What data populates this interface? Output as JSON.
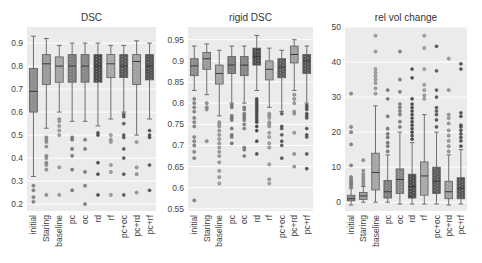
{
  "chart_data": [
    {
      "type": "box",
      "title": "DSC",
      "xlabel": "",
      "ylabel": "",
      "ylim": [
        0.17,
        0.97
      ],
      "yticks": [
        0.2,
        0.3,
        0.4,
        0.5,
        0.6,
        0.7,
        0.8,
        0.9
      ],
      "ytick_labels": [
        "0.2",
        "0.3",
        "0.4",
        "0.5",
        "0.6",
        "0.7",
        "0.8",
        "0.9"
      ],
      "grid": true,
      "categories": [
        "initial",
        "Staring",
        "baseline",
        "pc",
        "oc",
        "rd",
        "rf",
        "pc+oc",
        "pc+rd",
        "pc+rf"
      ],
      "series": [
        {
          "name": "initial",
          "whisker_high": 0.93,
          "q3": 0.79,
          "median": 0.69,
          "q1": 0.6,
          "whisker_low": 0.32,
          "outliers": [
            0.28,
            0.26,
            0.23,
            0.21
          ]
        },
        {
          "name": "Staring",
          "whisker_high": 0.92,
          "q3": 0.85,
          "median": 0.81,
          "q1": 0.72,
          "whisker_low": 0.53,
          "outliers": [
            0.49,
            0.48,
            0.47,
            0.45,
            0.41,
            0.4,
            0.38,
            0.37,
            0.35,
            0.24
          ]
        },
        {
          "name": "baseline",
          "whisker_high": 0.89,
          "q3": 0.84,
          "median": 0.8,
          "q1": 0.73,
          "whisker_low": 0.6,
          "outliers": [
            0.57,
            0.56,
            0.54,
            0.52,
            0.5,
            0.36,
            0.24
          ]
        },
        {
          "name": "pc",
          "whisker_high": 0.9,
          "q3": 0.85,
          "median": 0.8,
          "q1": 0.73,
          "whisker_low": 0.56,
          "outliers": [
            0.49,
            0.48,
            0.44,
            0.41,
            0.35,
            0.26
          ]
        },
        {
          "name": "oc",
          "whisker_high": 0.9,
          "q3": 0.85,
          "median": 0.8,
          "q1": 0.73,
          "whisker_low": 0.56,
          "outliers": [
            0.48,
            0.44,
            0.34,
            0.28,
            0.2
          ]
        },
        {
          "name": "rd",
          "whisker_high": 0.9,
          "q3": 0.85,
          "median": 0.8,
          "q1": 0.73,
          "whisker_low": 0.54,
          "outliers": [
            0.51,
            0.5,
            0.38,
            0.33,
            0.24
          ]
        },
        {
          "name": "rf",
          "whisker_high": 0.89,
          "q3": 0.85,
          "median": 0.81,
          "q1": 0.75,
          "whisker_low": 0.57,
          "outliers": [
            0.5,
            0.48,
            0.47,
            0.37,
            0.34,
            0.24
          ]
        },
        {
          "name": "pc+oc",
          "whisker_high": 0.89,
          "q3": 0.85,
          "median": 0.8,
          "q1": 0.75,
          "whisker_low": 0.6,
          "outliers": [
            0.59,
            0.58,
            0.55,
            0.5,
            0.49,
            0.44,
            0.4,
            0.33,
            0.24
          ]
        },
        {
          "name": "pc+rd",
          "whisker_high": 0.91,
          "q3": 0.85,
          "median": 0.82,
          "q1": 0.72,
          "whisker_low": 0.5,
          "outliers": [
            0.47,
            0.36,
            0.33,
            0.25
          ]
        },
        {
          "name": "pc+rf",
          "whisker_high": 0.9,
          "q3": 0.85,
          "median": 0.8,
          "q1": 0.74,
          "whisker_low": 0.57,
          "outliers": [
            0.52,
            0.5,
            0.49,
            0.37,
            0.26
          ]
        }
      ]
    },
    {
      "type": "box",
      "title": "rigid DSC",
      "xlabel": "",
      "ylabel": "",
      "ylim": [
        0.545,
        0.98
      ],
      "yticks": [
        0.55,
        0.6,
        0.65,
        0.7,
        0.75,
        0.8,
        0.85,
        0.9,
        0.95
      ],
      "ytick_labels": [
        "0.55",
        "0.6",
        "0.65",
        "0.7",
        "0.75",
        "0.8",
        "0.85",
        "0.9",
        "0.95"
      ],
      "grid": true,
      "categories": [
        "initial",
        "Staring",
        "baseline",
        "pc",
        "oc",
        "rd",
        "rf",
        "pc+oc",
        "pc+rd",
        "pc+rf"
      ],
      "series": [
        {
          "name": "initial",
          "whisker_high": 0.935,
          "q3": 0.905,
          "median": 0.888,
          "q1": 0.865,
          "whisker_low": 0.83,
          "outliers": [
            0.81,
            0.8,
            0.79,
            0.78,
            0.765,
            0.755,
            0.745,
            0.72,
            0.71,
            0.7,
            0.685,
            0.67,
            0.57
          ]
        },
        {
          "name": "Staring",
          "whisker_high": 0.94,
          "q3": 0.92,
          "median": 0.905,
          "q1": 0.88,
          "whisker_low": 0.82,
          "outliers": [
            0.8,
            0.79,
            0.785,
            0.71
          ]
        },
        {
          "name": "baseline",
          "whisker_high": 0.925,
          "q3": 0.89,
          "median": 0.87,
          "q1": 0.845,
          "whisker_low": 0.77,
          "outliers": [
            0.755,
            0.75,
            0.745,
            0.735,
            0.725,
            0.715,
            0.705,
            0.695,
            0.685,
            0.675,
            0.66,
            0.64,
            0.625,
            0.61
          ]
        },
        {
          "name": "pc",
          "whisker_high": 0.935,
          "q3": 0.91,
          "median": 0.89,
          "q1": 0.87,
          "whisker_low": 0.8,
          "outliers": [
            0.795,
            0.79,
            0.77,
            0.765,
            0.76,
            0.74,
            0.725,
            0.72,
            0.705
          ]
        },
        {
          "name": "oc",
          "whisker_high": 0.935,
          "q3": 0.91,
          "median": 0.89,
          "q1": 0.865,
          "whisker_low": 0.8,
          "outliers": [
            0.79,
            0.785,
            0.775,
            0.77,
            0.765,
            0.76,
            0.75,
            0.74,
            0.695,
            0.69,
            0.675
          ]
        },
        {
          "name": "rd",
          "whisker_high": 0.96,
          "q3": 0.93,
          "median": 0.91,
          "q1": 0.89,
          "whisker_low": 0.83,
          "outliers": [
            0.81,
            0.805,
            0.8,
            0.795,
            0.79,
            0.785,
            0.78,
            0.775,
            0.77,
            0.765,
            0.76,
            0.755,
            0.745,
            0.735,
            0.71,
            0.68
          ]
        },
        {
          "name": "rf",
          "whisker_high": 0.93,
          "q3": 0.9,
          "median": 0.88,
          "q1": 0.855,
          "whisker_low": 0.79,
          "outliers": [
            0.775,
            0.77,
            0.765,
            0.755,
            0.75,
            0.745,
            0.73,
            0.72,
            0.705,
            0.695,
            0.655,
            0.62,
            0.61
          ]
        },
        {
          "name": "pc+oc",
          "whisker_high": 0.925,
          "q3": 0.905,
          "median": 0.885,
          "q1": 0.86,
          "whisker_low": 0.78,
          "outliers": [
            0.775,
            0.745,
            0.74,
            0.725,
            0.71,
            0.7,
            0.67
          ]
        },
        {
          "name": "pc+rd",
          "whisker_high": 0.95,
          "q3": 0.935,
          "median": 0.915,
          "q1": 0.895,
          "whisker_low": 0.83,
          "outliers": [
            0.82,
            0.81,
            0.8,
            0.78,
            0.775,
            0.73,
            0.68,
            0.65
          ]
        },
        {
          "name": "pc+rf",
          "whisker_high": 0.935,
          "q3": 0.915,
          "median": 0.9,
          "q1": 0.87,
          "whisker_low": 0.8,
          "outliers": [
            0.795,
            0.79,
            0.785,
            0.775,
            0.77,
            0.765,
            0.74,
            0.725,
            0.72,
            0.68,
            0.645
          ]
        }
      ]
    },
    {
      "type": "box",
      "title": "rel vol change",
      "xlabel": "",
      "ylabel": "",
      "ylim": [
        -2.5,
        50
      ],
      "yticks": [
        0,
        10,
        20,
        30,
        40,
        50
      ],
      "ytick_labels": [
        "0",
        "10",
        "20",
        "30",
        "40",
        "50"
      ],
      "grid": true,
      "categories": [
        "initial",
        "Staring",
        "baseline",
        "pc",
        "oc",
        "rd",
        "rf",
        "pc+oc",
        "pc+rd",
        "pc+rf"
      ],
      "series": [
        {
          "name": "initial",
          "whisker_high": 4.0,
          "q3": 2.0,
          "median": 1.0,
          "q1": 0.4,
          "whisker_low": -0.8,
          "outliers": [
            4.5,
            5.0,
            5.5,
            6.0,
            6.5,
            7.2,
            10.5,
            16.5,
            20.0,
            21.5,
            31.0
          ]
        },
        {
          "name": "Staring",
          "whisker_high": 4.5,
          "q3": 2.8,
          "median": 1.8,
          "q1": 0.8,
          "whisker_low": 0.0,
          "outliers": [
            5.0,
            5.8,
            6.5,
            7.2,
            8.0,
            9.0,
            12.0
          ]
        },
        {
          "name": "baseline",
          "whisker_high": 27.5,
          "q3": 14.0,
          "median": 8.5,
          "q1": 3.5,
          "whisker_low": 0.0,
          "outliers": [
            31.0,
            32.5,
            34.0,
            35.0,
            36.0,
            37.0,
            38.0,
            43.0,
            47.5
          ]
        },
        {
          "name": "pc",
          "whisker_high": 13.5,
          "q3": 6.2,
          "median": 3.0,
          "q1": 1.2,
          "whisker_low": 0.0,
          "outliers": [
            14.5,
            16.0,
            17.0,
            18.5,
            19.5,
            21.0,
            24.5,
            29.5,
            32.0
          ]
        },
        {
          "name": "oc",
          "whisker_high": 20.0,
          "q3": 9.5,
          "median": 6.5,
          "q1": 2.5,
          "whisker_low": -0.5,
          "outliers": [
            21.5,
            23.0,
            25.0,
            26.0,
            27.0,
            28.0,
            31.5,
            35.0,
            43.0
          ]
        },
        {
          "name": "rd",
          "whisker_high": 17.0,
          "q3": 8.0,
          "median": 4.5,
          "q1": 1.2,
          "whisker_low": -0.5,
          "outliers": [
            18.0,
            19.0,
            20.0,
            21.0,
            22.0,
            23.0,
            24.0,
            25.0,
            26.0,
            27.0,
            28.0,
            29.5,
            35.5,
            38.0
          ]
        },
        {
          "name": "rf",
          "whisker_high": 25.0,
          "q3": 11.5,
          "median": 7.5,
          "q1": 2.0,
          "whisker_low": -0.5,
          "outliers": [
            29.5,
            30.5,
            32.0,
            33.5,
            38.0,
            44.0,
            47.5
          ]
        },
        {
          "name": "pc+oc",
          "whisker_high": 20.0,
          "q3": 10.0,
          "median": 6.0,
          "q1": 2.5,
          "whisker_low": -0.5,
          "outliers": [
            21.5,
            23.5,
            25.0,
            26.0,
            27.0,
            30.0,
            32.0,
            37.5,
            44.5
          ]
        },
        {
          "name": "pc+rd",
          "whisker_high": 13.5,
          "q3": 6.0,
          "median": 3.0,
          "q1": 1.0,
          "whisker_low": -0.8,
          "outliers": [
            14.5,
            16.0,
            17.5,
            19.0,
            20.5,
            22.5,
            24.0,
            25.0,
            32.0,
            41.0
          ]
        },
        {
          "name": "pc+rf",
          "whisker_high": 15.0,
          "q3": 7.0,
          "median": 4.0,
          "q1": 1.0,
          "whisker_low": -0.5,
          "outliers": [
            16.0,
            17.5,
            18.5,
            19.5,
            20.5,
            21.5,
            22.0,
            24.5,
            25.5,
            38.0,
            39.5
          ]
        }
      ]
    }
  ],
  "palette": [
    "#8c8c8c",
    "#9a9a9a",
    "#a5a5a5",
    "#7e7e7e",
    "#868686",
    "#4a4a4a",
    "#a8a8a8",
    "#5a5a5a",
    "#a0a0a0",
    "#545454"
  ],
  "style": {
    "plot_background": "#ebebeb",
    "grid_color": "#ffffff",
    "page_background": "#ffffff",
    "whisker_color": "#6e6e6e",
    "text_color": "#444444"
  }
}
